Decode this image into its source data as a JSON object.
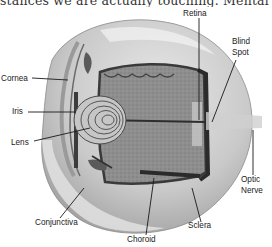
{
  "header": {
    "cropped_text": "stances we are actually touching. Mental"
  },
  "diagram": {
    "colors": {
      "background": "#ffffff",
      "sclera": "#d9d9d9",
      "vitreous": "#8f8f8f",
      "choroid": "#3a3a3a",
      "lens": "#bdbdbd",
      "label_text": "#222222",
      "leader_line": "#1a1a1a"
    },
    "labels": {
      "retina": "Retina",
      "blind_spot_1": "Blind",
      "blind_spot_2": "Spot",
      "cornea": "Cornea",
      "iris": "Iris",
      "lens": "Lens",
      "optic_nerve_1": "Optic",
      "optic_nerve_2": "Nerve",
      "conjunctiva": "Conjunctiva",
      "choroid": "Choroid",
      "sclera": "Sclera"
    }
  }
}
